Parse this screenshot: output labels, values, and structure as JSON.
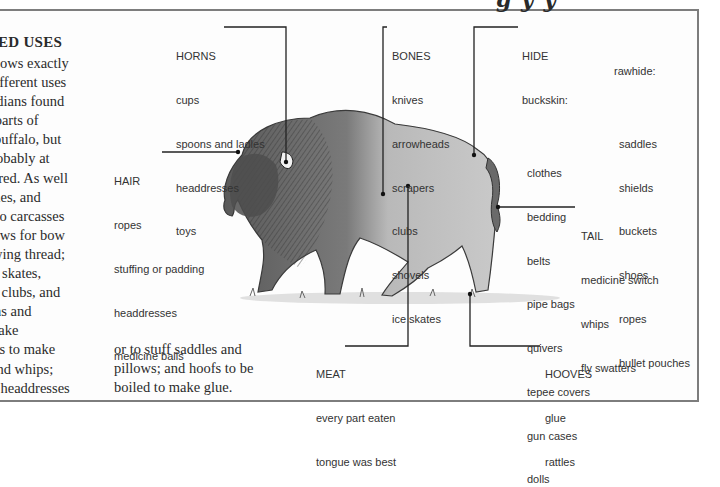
{
  "page": {
    "top_title_fragment": "g y y",
    "section_heading": "ED USES",
    "body_lines": [
      "ows exactly",
      "different uses",
      "ndians found",
      "l parts of",
      "buffalo, but",
      "probably at",
      "ored. As well",
      "ones, and",
      "alo carcasses",
      "inews for bow",
      "sewing thread;",
      "e skates,",
      "r clubs, and",
      "ths and",
      "make",
      "tails to make",
      "and whips;",
      "r headdresses"
    ],
    "body_col2_lines": [
      "or to stuff saddles and",
      "pillows; and hoofs to be",
      "boiled to make glue."
    ]
  },
  "callouts": {
    "horns": {
      "title": "HORNS",
      "items": [
        "cups",
        "spoons and ladles",
        "headdresses",
        "toys"
      ]
    },
    "hair": {
      "title": "HAIR",
      "items": [
        "ropes",
        "stuffing or padding",
        "headdresses",
        "medicine balls"
      ]
    },
    "bones": {
      "title": "BONES",
      "items": [
        "knives",
        "arrowheads",
        "scrapers",
        "clubs",
        "shovels",
        "ice skates"
      ]
    },
    "hide": {
      "title": "HIDE",
      "buckskin": {
        "label": "buckskin:",
        "items": [
          "clothes",
          "bedding",
          "belts",
          "pipe bags",
          "quivers",
          "tepee covers",
          "gun cases",
          "dolls"
        ]
      },
      "rawhide": {
        "label": "rawhide:",
        "items": [
          "saddles",
          "shields",
          "buckets",
          "shoes",
          "ropes",
          "bullet pouches"
        ]
      }
    },
    "tail": {
      "title": "TAIL",
      "items": [
        "medicine switch",
        "whips",
        "fly swatters"
      ]
    },
    "meat": {
      "title": "MEAT",
      "items": [
        "every part eaten",
        "tongue was best"
      ]
    },
    "hooves": {
      "title": "HOOVES",
      "items": [
        "glue",
        "rattles"
      ]
    }
  },
  "illustration": {
    "subject": "bison"
  }
}
